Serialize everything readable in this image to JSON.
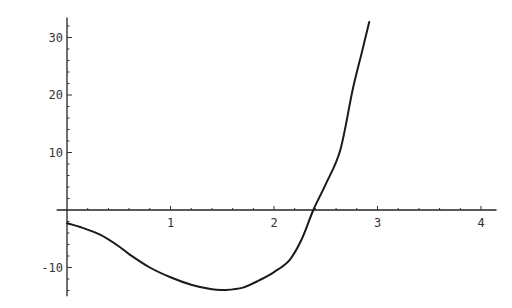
{
  "chart_data": {
    "type": "line",
    "title": "",
    "xlabel": "",
    "ylabel": "",
    "xlim": [
      -0.1,
      4.15
    ],
    "ylim": [
      -15,
      33.5
    ],
    "grid": false,
    "legend": null,
    "x_ticks": [
      1,
      2,
      3,
      4
    ],
    "x_tick_labels": [
      "1",
      "2",
      "3",
      "4"
    ],
    "y_ticks": [
      -10,
      10,
      20,
      30
    ],
    "y_tick_labels": [
      "-10",
      "10",
      "20",
      "30"
    ],
    "series": [
      {
        "name": "f(x)",
        "color": "#1a1a1a",
        "x": [
          0.0,
          0.15,
          0.32,
          0.5,
          0.61,
          0.8,
          1.0,
          1.2,
          1.4,
          1.53,
          1.7,
          1.86,
          2.0,
          2.15,
          2.27,
          2.38,
          2.5,
          2.64,
          2.76,
          2.85,
          2.92
        ],
        "y": [
          -2.3,
          -3.1,
          -4.3,
          -6.3,
          -7.8,
          -10.0,
          -11.7,
          -13.0,
          -13.8,
          -13.9,
          -13.5,
          -12.2,
          -10.8,
          -8.7,
          -5.0,
          0.0,
          4.5,
          10.4,
          20.9,
          27.5,
          32.7
        ]
      }
    ]
  }
}
